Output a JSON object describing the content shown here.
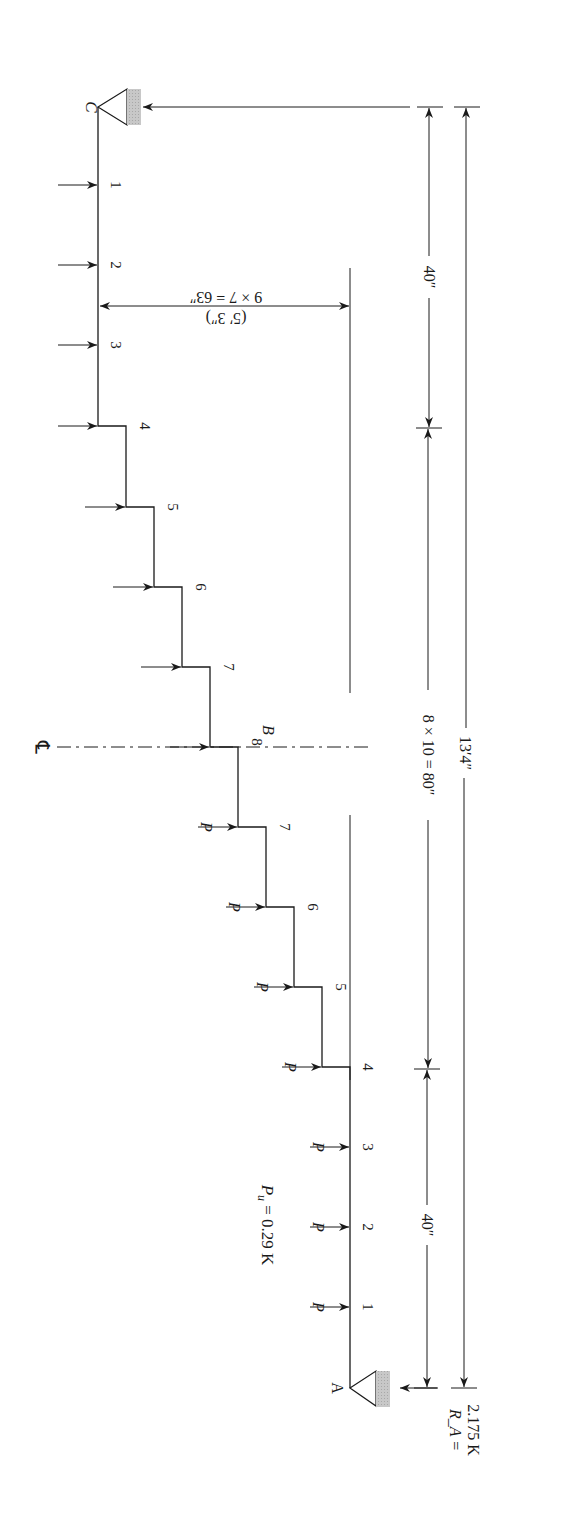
{
  "diagram": {
    "type": "staircase-beam-loading",
    "orientation": "rotated 90deg clockwise",
    "load_label": "P_u = 0.29 K",
    "load_symbol": "P",
    "load_value": "0.29 K",
    "supports": {
      "A": {
        "label": "A",
        "reaction_label": "R_A =",
        "reaction_value": "2.175 K"
      },
      "C": {
        "label": "C"
      }
    },
    "centerline": {
      "symbol": "℄",
      "point_label": "B",
      "node": "8"
    },
    "nodes_lower_flight": [
      "1",
      "2",
      "3",
      "4",
      "5",
      "6",
      "7"
    ],
    "node_mid": "8",
    "nodes_upper_flight": [
      "7",
      "6",
      "5",
      "4",
      "3",
      "2",
      "1"
    ],
    "dimensions": {
      "lower_landing": "40″",
      "flight": "8 × 10 = 80″",
      "upper_landing": "40″",
      "total": "13′4″",
      "rise_line1": "9 × 7 = 63″",
      "rise_line2": "(5′ 3″)"
    }
  }
}
